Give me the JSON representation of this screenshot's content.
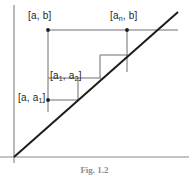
{
  "figure": {
    "caption": "Fig. 1.2",
    "colors": {
      "axis": "#8a8a8a",
      "diagonal": "#1c1c1c",
      "construction": "#6e6e6e",
      "label_text": "#262626",
      "caption_text": "#8c8c8c",
      "background": "#ffffff"
    },
    "axes": {
      "origin": {
        "x": 14,
        "y": 157
      },
      "y_axis": {
        "x": 14,
        "y_top": 5,
        "y_bottom": 163
      },
      "x_axis": {
        "y": 157,
        "x_left": 0,
        "x_right": 189
      }
    },
    "diagonal": {
      "name": "identity-line",
      "from": {
        "x": 14,
        "y": 157
      },
      "to": {
        "x": 178,
        "y": 12
      }
    },
    "labels": [
      {
        "id": "a-b",
        "text_main": "[a, b]",
        "base": "[a, b]",
        "sub": "",
        "x": 28,
        "y": 11
      },
      {
        "id": "an-b",
        "text_main": "[a",
        "base": "[a",
        "sub": "n",
        "tail": ", b]",
        "x": 110,
        "y": 11
      },
      {
        "id": "a1-a2",
        "text_main": "[a",
        "base": "[a",
        "sub": "1",
        "mid": ", a",
        "sub2": "2",
        "tail": "]",
        "x": 50,
        "y": 71
      },
      {
        "id": "a-a1",
        "text_main": "[a, a",
        "base": "[a, a",
        "sub": "1",
        "tail": "]",
        "x": 18,
        "y": 93
      }
    ],
    "label_text": {
      "a_b": "[a, b]",
      "an_b_base": "[a",
      "an_b_sub": "n",
      "an_b_tail": ", b]",
      "a1_a2_base": "[a",
      "a1_a2_sub1": "1",
      "a1_a2_mid": ", a",
      "a1_a2_sub2": "2",
      "a1_a2_tail": "]",
      "a_a1_base": "[a, a",
      "a_a1_sub": "1",
      "a_a1_tail": "]"
    },
    "points": [
      {
        "name": "point-a-b",
        "x": 48,
        "y": 30
      },
      {
        "name": "point-an-b",
        "x": 127,
        "y": 30
      },
      {
        "name": "point-a-a1",
        "x": 48,
        "y": 100
      }
    ],
    "construction_segments": [
      {
        "name": "top-horizontal-a-b-to-an-b",
        "x1": 48,
        "y1": 30,
        "x2": 178,
        "y2": 30
      },
      {
        "name": "left-vertical-a-b",
        "x1": 48,
        "y1": 30,
        "x2": 48,
        "y2": 112
      },
      {
        "name": "right-vertical-an-b",
        "x1": 127,
        "y1": 30,
        "x2": 127,
        "y2": 72
      },
      {
        "name": "step3-horizontal",
        "x1": 100,
        "y1": 55,
        "x2": 127,
        "y2": 55
      },
      {
        "name": "step3-vertical",
        "x1": 100,
        "y1": 55,
        "x2": 100,
        "y2": 78
      },
      {
        "name": "step2-horizontal",
        "x1": 48,
        "y1": 78,
        "x2": 100,
        "y2": 78
      },
      {
        "name": "step2-vertical",
        "x1": 78,
        "y1": 78,
        "x2": 78,
        "y2": 100
      },
      {
        "name": "step1-horizontal",
        "x1": 48,
        "y1": 100,
        "x2": 78,
        "y2": 100
      }
    ]
  }
}
